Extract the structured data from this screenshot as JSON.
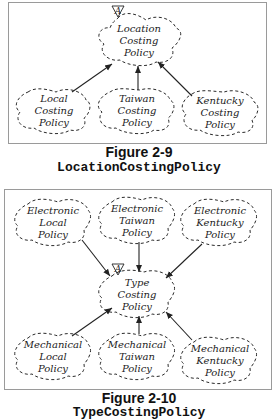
{
  "figures": [
    {
      "caption_title": "Figure 2-9",
      "caption_class": "LocationCostingPolicy",
      "abstract_marker": "A",
      "top_class": [
        "Location",
        "Costing",
        "Policy"
      ],
      "subclasses": [
        [
          "Local",
          "Costing",
          "Policy"
        ],
        [
          "Taiwan",
          "Costing",
          "Policy"
        ],
        [
          "Kentucky",
          "Costing",
          "Policy"
        ]
      ]
    },
    {
      "caption_title": "Figure 2-10",
      "caption_class": "TypeCostingPolicy",
      "abstract_marker": "A",
      "center_class": [
        "Type",
        "Costing",
        "Policy"
      ],
      "upper_classes": [
        [
          "Electronic",
          "Local",
          "Policy"
        ],
        [
          "Electronic",
          "Taiwan",
          "Policy"
        ],
        [
          "Electronic",
          "Kentucky",
          "Policy"
        ]
      ],
      "lower_classes": [
        [
          "Mechanical",
          "Local",
          "Policy"
        ],
        [
          "Mechanical",
          "Taiwan",
          "Policy"
        ],
        [
          "Mechanical",
          "Kentucky",
          "Policy"
        ]
      ]
    }
  ]
}
